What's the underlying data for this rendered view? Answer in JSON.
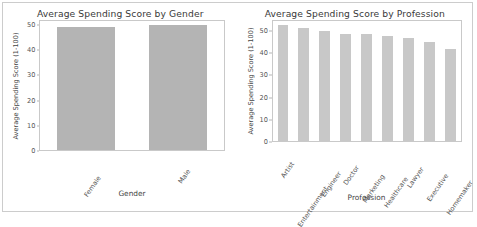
{
  "figure": {
    "background": "#ffffff",
    "frame_color": "#cccccc"
  },
  "chart_data": [
    {
      "type": "bar",
      "title": "Average Spending Score by Gender",
      "xlabel": "Gender",
      "ylabel": "Average Spending Score (1-100)",
      "categories": [
        "Female",
        "Male"
      ],
      "values": [
        49.4,
        50.2
      ],
      "ylim": [
        0,
        52
      ],
      "yticks": [
        0,
        10,
        20,
        30,
        40,
        50
      ],
      "ytick_labels": [
        "0",
        "10",
        "20",
        "30",
        "40",
        "50"
      ],
      "grid": false,
      "legend": "none",
      "bar_color": "#b4b4b4"
    },
    {
      "type": "bar",
      "title": "Average Spending Score by Profession",
      "xlabel": "Profession",
      "ylabel": "Average Spending Score (1-100)",
      "categories": [
        "Artist",
        "Entertainment",
        "Engineer",
        "Doctor",
        "Marketing",
        "Healthcare",
        "Lawyer",
        "Executive",
        "Homemaker"
      ],
      "values": [
        53.0,
        52.0,
        50.2,
        49.2,
        49.1,
        48.3,
        47.0,
        45.6,
        42.4
      ],
      "ylim": [
        0,
        55
      ],
      "yticks": [
        0,
        10,
        20,
        30,
        40,
        50
      ],
      "ytick_labels": [
        "0",
        "10",
        "20",
        "30",
        "40",
        "50"
      ],
      "grid": false,
      "legend": "none",
      "bar_color": "#c8c8c8"
    }
  ]
}
